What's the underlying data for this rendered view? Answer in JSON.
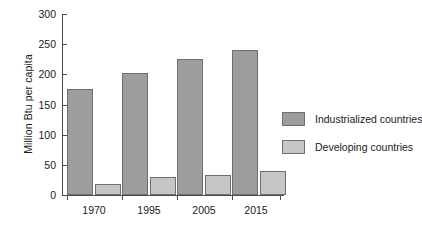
{
  "chart_data": {
    "type": "bar",
    "title": "",
    "xlabel": "",
    "ylabel": "Million Btu per capita",
    "categories": [
      "1970",
      "1995",
      "2005",
      "2015"
    ],
    "series": [
      {
        "name": "Industrialized countries",
        "color": "#9d9d9d",
        "values": [
          175,
          203,
          225,
          241
        ]
      },
      {
        "name": "Developing countries",
        "color": "#c6c6c6",
        "values": [
          18,
          30,
          33,
          40
        ]
      }
    ],
    "ylim": [
      0,
      300
    ],
    "yticks": [
      0,
      50,
      100,
      150,
      200,
      250,
      300
    ],
    "ytick_labels": [
      "0",
      "50",
      "100",
      "150",
      "200",
      "250",
      "300"
    ],
    "grid": false,
    "legend_position": "right"
  },
  "legend": {
    "entries": [
      {
        "label": "Industrialized countries",
        "swatch": "dark"
      },
      {
        "label": "Developing countries",
        "swatch": "light"
      }
    ]
  }
}
